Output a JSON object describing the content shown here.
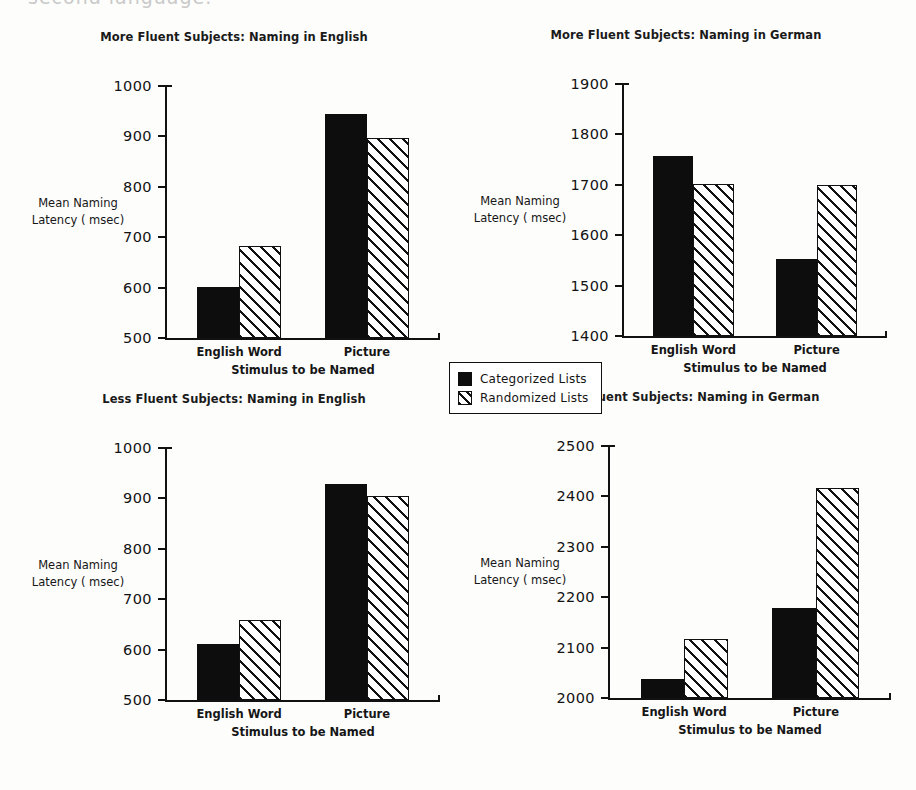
{
  "page": {
    "cut_off_text_top": "second language.",
    "axis_label_y": "Mean Naming\nLatency ( msec)",
    "axis_label_y_line1": "Mean Naming",
    "axis_label_y_line2": "Latency ( msec)",
    "axis_label_x": "Stimulus to be Named"
  },
  "legend": {
    "items": [
      {
        "label": "Categorized Lists",
        "pattern": "solid",
        "color": "#0d0d0d"
      },
      {
        "label": "Randomized Lists",
        "pattern": "hatch",
        "color": "#ffffff"
      }
    ]
  },
  "chart_data": [
    {
      "id": "more-fluent-english",
      "type": "bar",
      "title": "More Fluent Subjects: Naming in English",
      "xlabel": "Stimulus to be Named",
      "ylabel": "Mean Naming Latency ( msec)",
      "categories": [
        "English Word",
        "Picture"
      ],
      "ylim": [
        500,
        1000
      ],
      "yticks": [
        500,
        600,
        700,
        800,
        900,
        1000
      ],
      "grid": false,
      "legend_position": "figure-center",
      "series": [
        {
          "name": "Categorized Lists",
          "values": [
            602,
            944
          ]
        },
        {
          "name": "Randomized Lists",
          "values": [
            682,
            896
          ]
        }
      ]
    },
    {
      "id": "more-fluent-german",
      "type": "bar",
      "title": "More Fluent Subjects: Naming in German",
      "xlabel": "Stimulus to be Named",
      "ylabel": "Mean Naming Latency ( msec)",
      "categories": [
        "English Word",
        "Picture"
      ],
      "ylim": [
        1400,
        1900
      ],
      "yticks": [
        1400,
        1500,
        1600,
        1700,
        1800,
        1900
      ],
      "grid": false,
      "legend_position": "figure-center",
      "series": [
        {
          "name": "Categorized Lists",
          "values": [
            1758,
            1552
          ]
        },
        {
          "name": "Randomized Lists",
          "values": [
            1702,
            1700
          ]
        }
      ]
    },
    {
      "id": "less-fluent-english",
      "type": "bar",
      "title": "Less Fluent Subjects: Naming in English",
      "xlabel": "Stimulus to be Named",
      "ylabel": "Mean Naming Latency ( msec)",
      "categories": [
        "English Word",
        "Picture"
      ],
      "ylim": [
        500,
        1000
      ],
      "yticks": [
        500,
        600,
        700,
        800,
        900,
        1000
      ],
      "grid": false,
      "legend_position": "figure-center",
      "series": [
        {
          "name": "Categorized Lists",
          "values": [
            612,
            928
          ]
        },
        {
          "name": "Randomized Lists",
          "values": [
            658,
            904
          ]
        }
      ]
    },
    {
      "id": "less-fluent-german",
      "type": "bar",
      "title": "Less Fluent Subjects: Naming in German",
      "xlabel": "Stimulus to be Named",
      "ylabel": "Mean Naming Latency ( msec)",
      "categories": [
        "English Word",
        "Picture"
      ],
      "ylim": [
        2000,
        2500
      ],
      "yticks": [
        2000,
        2100,
        2200,
        2300,
        2400,
        2500
      ],
      "grid": false,
      "legend_position": "figure-center",
      "series": [
        {
          "name": "Categorized Lists",
          "values": [
            2038,
            2178
          ]
        },
        {
          "name": "Randomized Lists",
          "values": [
            2118,
            2416
          ]
        }
      ]
    }
  ]
}
